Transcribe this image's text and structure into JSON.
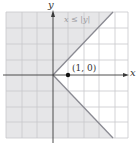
{
  "diagram": {
    "region_label": "x ≤ |y|",
    "point_label": "(1, 0)",
    "x_axis_label": "x",
    "y_axis_label": "y",
    "grid": {
      "x_min": -3,
      "x_max": 5,
      "y_min": -4,
      "y_max": 4
    },
    "point": {
      "x": 1,
      "y": 0
    },
    "colors": {
      "shade": "#e6e6e8",
      "grid": "#c8c8cc",
      "boundary": "#8a8a92",
      "axis": "#3a3a3a",
      "point": "#111111"
    }
  }
}
